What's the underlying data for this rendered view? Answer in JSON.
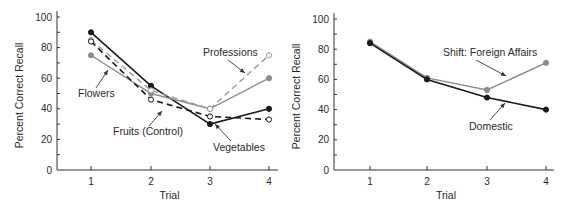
{
  "chart_data": [
    {
      "type": "line",
      "title": "",
      "xlabel": "Trial",
      "ylabel": "Percent Correct Recall",
      "x": [
        1,
        2,
        3,
        4
      ],
      "xticks": [
        "1",
        "2",
        "3",
        "4"
      ],
      "yticks": [
        "0",
        "20",
        "40",
        "60",
        "80",
        "100"
      ],
      "ylim": [
        0,
        100
      ],
      "grid": false,
      "legend": "none (inline annotations with arrows)",
      "series": [
        {
          "name": "Vegetables",
          "values": [
            90,
            55,
            30,
            40
          ],
          "color": "#1a1a1a",
          "dash": "solid",
          "marker": "filled"
        },
        {
          "name": "Flowers",
          "values": [
            75,
            50,
            40,
            60
          ],
          "color": "#8c8c8c",
          "dash": "solid",
          "marker": "filled"
        },
        {
          "name": "Professions",
          "values": [
            85,
            52,
            40,
            75
          ],
          "color": "#9a9a9a",
          "dash": "dashed",
          "marker": "open"
        },
        {
          "name": "Fruits (Control)",
          "values": [
            84,
            46,
            35,
            33
          ],
          "color": "#1a1a1a",
          "dash": "dashed",
          "marker": "open"
        }
      ],
      "annotations": [
        {
          "text": "Professions",
          "target_series": "Professions"
        },
        {
          "text": "Flowers",
          "target_series": "Flowers"
        },
        {
          "text": "Fruits (Control)",
          "target_series": "Fruits (Control)"
        },
        {
          "text": "Vegetables",
          "target_series": "Vegetables"
        }
      ]
    },
    {
      "type": "line",
      "title": "",
      "xlabel": "Trial",
      "ylabel": "Percent Correct Recall",
      "x": [
        1,
        2,
        3,
        4
      ],
      "xticks": [
        "1",
        "2",
        "3",
        "4"
      ],
      "yticks": [
        "0",
        "20",
        "40",
        "60",
        "80",
        "100"
      ],
      "ylim": [
        0,
        100
      ],
      "grid": false,
      "legend": "none (inline annotations with arrows)",
      "series": [
        {
          "name": "Shift: Foreign Affairs",
          "values": [
            85,
            61,
            53,
            71
          ],
          "color": "#8c8c8c",
          "dash": "solid",
          "marker": "filled"
        },
        {
          "name": "Domestic",
          "values": [
            84,
            60,
            48,
            40
          ],
          "color": "#1a1a1a",
          "dash": "solid",
          "marker": "filled"
        }
      ],
      "annotations": [
        {
          "text": "Shift: Foreign Affairs",
          "target_series": "Shift: Foreign Affairs"
        },
        {
          "text": "Domestic",
          "target_series": "Domestic"
        }
      ]
    }
  ]
}
